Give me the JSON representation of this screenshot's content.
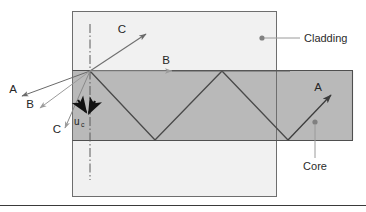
{
  "figure": {
    "background_color": "#ffffff"
  },
  "regions": {
    "cladding": {
      "label": "Cladding",
      "fill_color": "#f1f1f1",
      "stroke_color": "#6e6e6e"
    },
    "core": {
      "label": "Core",
      "fill_color": "#b9b9b9",
      "stroke_color": "#555555"
    }
  },
  "callouts": [
    {
      "name": "cladding-callout",
      "label": "Cladding",
      "dot_color": "#808080",
      "line_color": "#9a9a9a"
    },
    {
      "name": "core-callout",
      "label": "Core",
      "dot_color": "#808080",
      "line_color": "#9a9a9a"
    }
  ],
  "rays": {
    "incident_A": {
      "label": "A",
      "color": "#6a6a6a"
    },
    "incident_B": {
      "label": "B",
      "color": "#9b9b9b"
    },
    "incident_C": {
      "label": "C",
      "color": "#8a8a8a"
    },
    "refracted_C": {
      "label": "C",
      "color": "#6f6f6f"
    },
    "grazing_B": {
      "label": "B",
      "color": "#5f5f5f"
    },
    "guided_A": {
      "label": "A",
      "color": "#4a4a4a"
    },
    "exit_A": {
      "label": "A",
      "color": "#3c3c3c"
    }
  },
  "annotations": {
    "critical_angle": {
      "symbol": "u",
      "subscript": "c"
    },
    "normal_line": {
      "style": "dash-dot",
      "color": "#5a5a5a"
    }
  },
  "colors": {
    "ink": "#2b2b2b",
    "rule": "#3a3a3a"
  }
}
